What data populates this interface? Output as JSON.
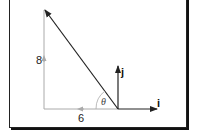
{
  "diagram": {
    "vertical_label": "8",
    "horizontal_label": "6",
    "angle_label": "θ",
    "unit_i_label": "i",
    "unit_j_label": "j",
    "colors": {
      "vector": "#222222",
      "component": "#999999",
      "frame": "#222222"
    }
  }
}
